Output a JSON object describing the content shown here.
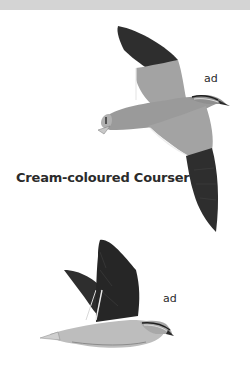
{
  "species": {
    "name": "Cream-coloured Courser"
  },
  "illustrations": [
    {
      "pose": "flying-overhead",
      "age_label": "ad"
    },
    {
      "pose": "flying-side",
      "age_label": "ad"
    }
  ],
  "colors": {
    "top_bar": "#d4d4d4",
    "wing_dark": "#2e2e2e",
    "body_grey": "#9a9a9a",
    "body_light": "#bdbdbd"
  }
}
